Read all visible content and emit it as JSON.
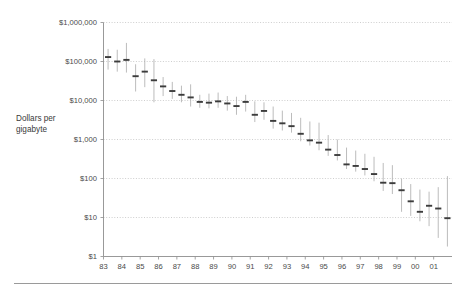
{
  "chart_data": {
    "type": "bar",
    "title": "",
    "subtitle": "",
    "xlabel": "",
    "ylabel": "Dollars per gigabyte",
    "yscale": "log",
    "ylim": [
      1,
      1000000
    ],
    "grid": true,
    "legend": null,
    "y_ticks": [
      {
        "value": 1000000,
        "label": "$1,000,000"
      },
      {
        "value": 100000,
        "label": "$100,000"
      },
      {
        "value": 10000,
        "label": "$10,000"
      },
      {
        "value": 1000,
        "label": "$1,000"
      },
      {
        "value": 100,
        "label": "$100"
      },
      {
        "value": 10,
        "label": "$10"
      },
      {
        "value": 1,
        "label": "$1"
      }
    ],
    "x_ticks": [
      "83",
      "84",
      "85",
      "86",
      "87",
      "88",
      "89",
      "90",
      "91",
      "92",
      "93",
      "94",
      "95",
      "96",
      "97",
      "98",
      "99",
      "00",
      "01"
    ],
    "x_range": [
      1983.0,
      2002.0
    ],
    "marker_note": "Each marker is a vertical price-range bar (low to high) with a horizontal tick at the median price; two markers per year (half-year steps).",
    "series": [
      {
        "name": "Dollars per gigabyte (price range and median)",
        "points": [
          {
            "x": 1983.25,
            "low": 62000,
            "high": 210000,
            "median": 130000
          },
          {
            "x": 1983.75,
            "low": 55000,
            "high": 200000,
            "median": 100000
          },
          {
            "x": 1984.25,
            "low": 52000,
            "high": 300000,
            "median": 110000
          },
          {
            "x": 1984.75,
            "low": 17000,
            "high": 85000,
            "median": 42000
          },
          {
            "x": 1985.25,
            "low": 22000,
            "high": 120000,
            "median": 55000
          },
          {
            "x": 1985.75,
            "low": 9000,
            "high": 115000,
            "median": 33000
          },
          {
            "x": 1986.25,
            "low": 13000,
            "high": 40000,
            "median": 23000
          },
          {
            "x": 1986.75,
            "low": 11000,
            "high": 30000,
            "median": 17500
          },
          {
            "x": 1987.25,
            "low": 9000,
            "high": 24000,
            "median": 14000
          },
          {
            "x": 1987.75,
            "low": 7000,
            "high": 26000,
            "median": 12000
          },
          {
            "x": 1988.25,
            "low": 6500,
            "high": 14000,
            "median": 9200
          },
          {
            "x": 1988.75,
            "low": 6300,
            "high": 15000,
            "median": 8800
          },
          {
            "x": 1989.25,
            "low": 6500,
            "high": 16000,
            "median": 9500
          },
          {
            "x": 1989.75,
            "low": 5500,
            "high": 13000,
            "median": 8400
          },
          {
            "x": 1990.25,
            "low": 4300,
            "high": 12500,
            "median": 7200
          },
          {
            "x": 1990.75,
            "low": 5200,
            "high": 14000,
            "median": 9200
          },
          {
            "x": 1991.25,
            "low": 2800,
            "high": 9500,
            "median": 4300
          },
          {
            "x": 1991.75,
            "low": 3200,
            "high": 9000,
            "median": 5400
          },
          {
            "x": 1992.25,
            "low": 1900,
            "high": 7000,
            "median": 3000
          },
          {
            "x": 1992.75,
            "low": 1700,
            "high": 5500,
            "median": 2600
          },
          {
            "x": 1993.25,
            "low": 1500,
            "high": 4800,
            "median": 2200
          },
          {
            "x": 1993.75,
            "low": 900,
            "high": 3600,
            "median": 1400
          },
          {
            "x": 1994.25,
            "low": 700,
            "high": 2900,
            "median": 950
          },
          {
            "x": 1994.75,
            "low": 530,
            "high": 2700,
            "median": 830
          },
          {
            "x": 1995.25,
            "low": 380,
            "high": 1300,
            "median": 550
          },
          {
            "x": 1995.75,
            "low": 290,
            "high": 1000,
            "median": 400
          },
          {
            "x": 1996.25,
            "low": 175,
            "high": 620,
            "median": 230
          },
          {
            "x": 1996.75,
            "low": 150,
            "high": 520,
            "median": 210
          },
          {
            "x": 1997.25,
            "low": 120,
            "high": 430,
            "median": 175
          },
          {
            "x": 1997.75,
            "low": 85,
            "high": 360,
            "median": 130
          },
          {
            "x": 1998.25,
            "low": 48,
            "high": 250,
            "median": 78
          },
          {
            "x": 1998.75,
            "low": 40,
            "high": 220,
            "median": 76
          },
          {
            "x": 1999.25,
            "low": 14,
            "high": 100,
            "median": 50
          },
          {
            "x": 1999.75,
            "low": 11,
            "high": 72,
            "median": 26
          },
          {
            "x": 2000.25,
            "low": 8,
            "high": 52,
            "median": 14
          },
          {
            "x": 2000.75,
            "low": 6,
            "high": 46,
            "median": 20
          },
          {
            "x": 2001.25,
            "low": 3,
            "high": 60,
            "median": 17
          },
          {
            "x": 2001.75,
            "low": 1.8,
            "high": 115,
            "median": 9.6
          }
        ]
      }
    ]
  },
  "colors": {
    "range_bar": "#b0b0b0",
    "median_tick": "#3c3c3c",
    "gridline": "#b9b9b9",
    "axis": "#8d8d8d",
    "text": "#3a3a3a",
    "background": "#ffffff"
  }
}
